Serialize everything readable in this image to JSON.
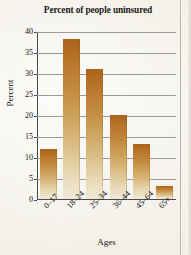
{
  "chart_data": {
    "type": "bar",
    "title": "Percent of people uninsured",
    "xlabel": "Ages",
    "ylabel": "Percent",
    "categories": [
      "0–17",
      "18–24",
      "25–34",
      "36–44",
      "45–64",
      "65+"
    ],
    "values": [
      12,
      38,
      31,
      20,
      13,
      3
    ],
    "ylim": [
      0,
      40
    ],
    "ytick_labels": [
      "0",
      "5",
      "10",
      "15",
      "20",
      "25",
      "30",
      "35",
      "40"
    ],
    "ytick_values": [
      0,
      5,
      10,
      15,
      20,
      25,
      30,
      35,
      40
    ],
    "grid": "horizontal",
    "legend": "none",
    "bar_color_top": "#a9631a",
    "bar_color_bottom": "#f0eadb",
    "axis_color": "#4a4a4a",
    "gridline_color": "#9a9a9a",
    "background_color": "#f5f2ea"
  }
}
